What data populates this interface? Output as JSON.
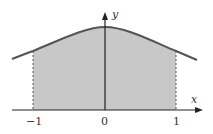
{
  "diagram": {
    "type": "area-under-curve",
    "axes": {
      "x_label": "x",
      "y_label": "y",
      "ticks": [
        {
          "value": -1,
          "label": "−1"
        },
        {
          "value": 0,
          "label": "0"
        },
        {
          "value": 1,
          "label": "1"
        }
      ]
    },
    "shaded_region": {
      "from": -1,
      "to": 1,
      "color": "#c8c8c8"
    },
    "colors": {
      "curve": "#555555",
      "axis": "#222222",
      "shade": "#c8c8c8",
      "dashed": "#555555"
    }
  }
}
